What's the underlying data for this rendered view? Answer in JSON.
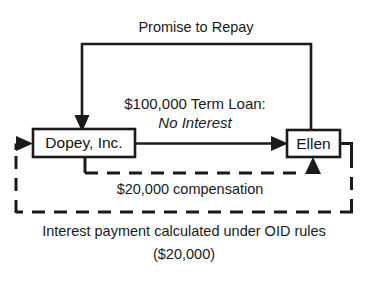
{
  "diagram": {
    "type": "flow-diagram",
    "title": "Promise to Repay",
    "background_color": "#ffffff",
    "line_color": "#1a1a1a",
    "nodes": [
      {
        "id": "dopey",
        "label": "Dopey, Inc."
      },
      {
        "id": "ellen",
        "label": "Ellen"
      }
    ],
    "labels": {
      "promise_to_repay": "Promise to Repay",
      "term_loan": "$100,000 Term Loan:",
      "no_interest": "No Interest",
      "compensation": "$20,000 compensation",
      "caption_line1": "Interest payment calculated under OID rules",
      "caption_line2": "($20,000)"
    },
    "edges": [
      {
        "id": "promise-edge",
        "from": "ellen",
        "to": "dopey",
        "label": "Promise to Repay",
        "style": "solid",
        "arrow": "down-into-dopey"
      },
      {
        "id": "loan-edge",
        "from": "dopey",
        "to": "ellen",
        "label": "$100,000 Term Loan: No Interest",
        "style": "solid",
        "arrow": "right-into-ellen"
      },
      {
        "id": "compensation-edge",
        "from": "dopey",
        "to": "ellen",
        "label": "$20,000 compensation",
        "style": "dashed",
        "arrow": "up-into-ellen"
      },
      {
        "id": "oid-interest-edge",
        "from": "ellen",
        "to": "dopey",
        "label": "Interest payment calculated under OID rules ($20,000)",
        "style": "dashed",
        "arrow": "right-into-dopey"
      }
    ]
  }
}
